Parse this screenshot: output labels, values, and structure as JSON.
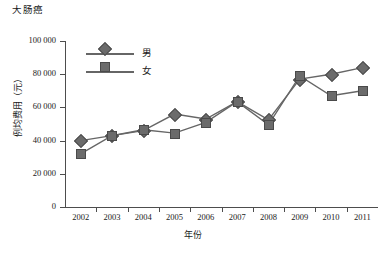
{
  "chart_data": {
    "type": "line",
    "title": "大肠癌",
    "subtitle": "",
    "xlabel": "年份",
    "ylabel": "例均费用（元）",
    "categories": [
      "2002",
      "2003",
      "2004",
      "2005",
      "2006",
      "2007",
      "2008",
      "2009",
      "2010",
      "2011"
    ],
    "x": [
      2002,
      2003,
      2004,
      2005,
      2006,
      2007,
      2008,
      2009,
      2010,
      2011
    ],
    "ylim": [
      0,
      100000
    ],
    "yticks": [
      0,
      20000,
      40000,
      60000,
      80000,
      100000
    ],
    "ytick_labels": [
      "0",
      "20 000",
      "40 000",
      "60 000",
      "80 000",
      "100 000"
    ],
    "grid": false,
    "legend_position": "upper-left-inside",
    "series": [
      {
        "name": "男",
        "marker": "diamond",
        "color": "#6b6b6b",
        "values": [
          40000,
          43000,
          46000,
          56000,
          53000,
          63500,
          52500,
          77000,
          80000,
          84000
        ]
      },
      {
        "name": "女",
        "marker": "square",
        "color": "#6b6b6b",
        "values": [
          32000,
          43000,
          46500,
          44500,
          51000,
          63500,
          49500,
          79000,
          67000,
          70000
        ]
      }
    ]
  },
  "legend": {
    "items": [
      {
        "label": "男",
        "marker": "diamond"
      },
      {
        "label": "女",
        "marker": "square"
      }
    ]
  },
  "axis": {
    "y_title": "例均费用（元）",
    "x_title": "年份"
  }
}
